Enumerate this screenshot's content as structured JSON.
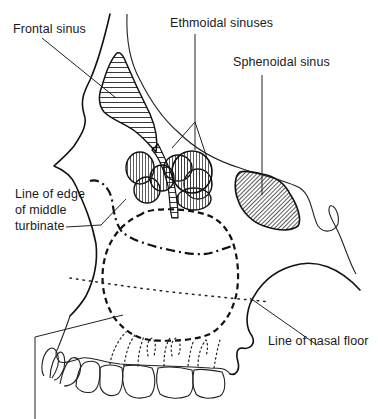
{
  "diagram": {
    "labels": {
      "frontal_sinus": "Frontal sinus",
      "ethmoidal_sinuses": "Ethmoidal sinuses",
      "sphenoidal_sinus": "Sphenoidal sinus",
      "middle_turbinate_line1": "Line of edge",
      "middle_turbinate_line2": "of middle",
      "middle_turbinate_line3": "turbinate",
      "nasal_floor": "Line of nasal floor"
    },
    "colors": {
      "ink": "#111111",
      "background": "#ffffff"
    }
  }
}
